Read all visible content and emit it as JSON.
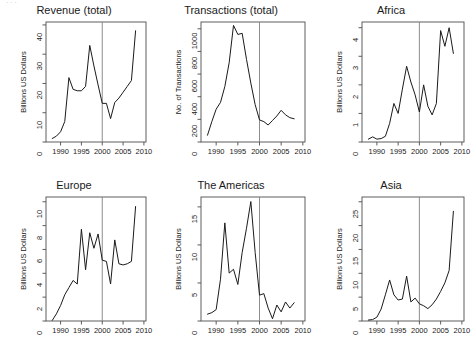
{
  "figure": {
    "background_color": "#ffffff",
    "line_color": "#1a1a1a",
    "axis_color": "#4d4d4d",
    "marker_line_color": "#808080",
    "top_crop_artifact": "·   ·        ·",
    "x_axis_ticks": [
      1990,
      1995,
      2000,
      2005,
      2010
    ],
    "x_axis_range": [
      1986.5,
      2010.5
    ],
    "vertical_marker_year": 2000
  },
  "panels": [
    {
      "id": "revenue-total",
      "title": "Revenue (total)",
      "ylabel": "Billions US Dollars"
    },
    {
      "id": "transactions-total",
      "title": "Transactions (total)",
      "ylabel": "No. of Transactions"
    },
    {
      "id": "africa",
      "title": "Africa",
      "ylabel": "Billions US Dollars"
    },
    {
      "id": "europe",
      "title": "Europe",
      "ylabel": "Billions US Dollars"
    },
    {
      "id": "the-americas",
      "title": "The Americas",
      "ylabel": "Billions US Dollars"
    },
    {
      "id": "asia",
      "title": "Asia",
      "ylabel": "Billions US Dollars"
    }
  ],
  "chart_data": [
    {
      "type": "line",
      "title": "Revenue (total)",
      "xlabel": "",
      "ylabel": "Billions US Dollars",
      "xlim": [
        1986.5,
        2010.5
      ],
      "ylim": [
        0,
        41
      ],
      "xticks": [
        1990,
        1995,
        2000,
        2005,
        2010
      ],
      "yticks": [
        0,
        10,
        20,
        30,
        40
      ],
      "grid": false,
      "legend": "none",
      "annotations": [
        {
          "type": "vline",
          "x": 2000
        }
      ],
      "x": [
        1988,
        1989,
        1990,
        1991,
        1992,
        1993,
        1994,
        1995,
        1996,
        1997,
        1998,
        1999,
        2000,
        2001,
        2002,
        2003,
        2004,
        2005,
        2006,
        2007,
        2008
      ],
      "values": [
        1.2,
        2.0,
        3.5,
        7.0,
        22.0,
        18.0,
        17.5,
        17.5,
        19.0,
        33.0,
        26.0,
        19.5,
        13.2,
        13.2,
        8.0,
        13.5,
        15.0,
        17.0,
        19.0,
        21.0,
        38.0
      ]
    },
    {
      "type": "line",
      "title": "Transactions (total)",
      "xlabel": "",
      "ylabel": "No. of Transactions",
      "xlim": [
        1986.5,
        2010.5
      ],
      "ylim": [
        0,
        1060
      ],
      "xticks": [
        1990,
        1995,
        2000,
        2005,
        2010
      ],
      "yticks": [
        0,
        200,
        400,
        600,
        800,
        1000
      ],
      "grid": false,
      "legend": "none",
      "annotations": [
        {
          "type": "vline",
          "x": 2000
        }
      ],
      "x": [
        1988,
        1989,
        1990,
        1991,
        1992,
        1993,
        1994,
        1995,
        1996,
        1997,
        1998,
        1999,
        2000,
        2001,
        2002,
        2003,
        2004,
        2005,
        2006,
        2007,
        2008
      ],
      "values": [
        60,
        180,
        290,
        350,
        490,
        700,
        1030,
        950,
        960,
        730,
        520,
        330,
        195,
        180,
        150,
        190,
        230,
        280,
        240,
        215,
        205
      ]
    },
    {
      "type": "line",
      "title": "Africa",
      "xlabel": "",
      "ylabel": "Billions US Dollars",
      "xlim": [
        1986.5,
        2010.5
      ],
      "ylim": [
        0,
        4.2
      ],
      "xticks": [
        1990,
        1995,
        2000,
        2005,
        2010
      ],
      "yticks": [
        0,
        1,
        2,
        3,
        4
      ],
      "grid": false,
      "legend": "none",
      "annotations": [
        {
          "type": "vline",
          "x": 2000
        }
      ],
      "x": [
        1988,
        1989,
        1990,
        1991,
        1992,
        1993,
        1994,
        1995,
        1996,
        1997,
        1998,
        1999,
        2000,
        2001,
        2002,
        2003,
        2004,
        2005,
        2006,
        2007,
        2008
      ],
      "values": [
        0.1,
        0.18,
        0.1,
        0.12,
        0.2,
        0.65,
        1.35,
        1.0,
        1.85,
        2.65,
        2.1,
        1.65,
        1.05,
        2.0,
        1.25,
        0.95,
        1.35,
        3.9,
        3.35,
        4.0,
        3.1
      ]
    },
    {
      "type": "line",
      "title": "Europe",
      "xlabel": "",
      "ylabel": "Billions US Dollars",
      "xlim": [
        1986.5,
        2010.5
      ],
      "ylim": [
        0,
        10.4
      ],
      "xticks": [
        1990,
        1995,
        2000,
        2005,
        2010
      ],
      "yticks": [
        0,
        2,
        4,
        6,
        8,
        10
      ],
      "grid": false,
      "legend": "none",
      "annotations": [
        {
          "type": "vline",
          "x": 2000
        }
      ],
      "x": [
        1988,
        1989,
        1990,
        1991,
        1992,
        1993,
        1994,
        1995,
        1996,
        1997,
        1998,
        1999,
        2000,
        2001,
        2002,
        2003,
        2004,
        2005,
        2006,
        2007,
        2008
      ],
      "values": [
        0.05,
        0.6,
        1.3,
        2.2,
        2.8,
        3.4,
        3.1,
        7.7,
        4.3,
        7.4,
        6.1,
        7.3,
        5.1,
        5.0,
        3.1,
        6.8,
        4.8,
        4.7,
        4.8,
        5.0,
        9.6
      ]
    },
    {
      "type": "line",
      "title": "The Americas",
      "xlabel": "",
      "ylabel": "Billions US Dollars",
      "xlim": [
        1986.5,
        2010.5
      ],
      "ylim": [
        0,
        16.3
      ],
      "xticks": [
        1990,
        1995,
        2000,
        2005,
        2010
      ],
      "yticks": [
        0,
        5,
        10,
        15
      ],
      "grid": false,
      "legend": "none",
      "annotations": [
        {
          "type": "vline",
          "x": 2000
        }
      ],
      "x": [
        1988,
        1989,
        1990,
        1991,
        1992,
        1993,
        1994,
        1995,
        1996,
        1997,
        1998,
        1999,
        2000,
        2001,
        2002,
        2003,
        2004,
        2005,
        2006,
        2007,
        2008
      ],
      "values": [
        0.9,
        1.1,
        1.5,
        5.5,
        12.9,
        6.3,
        6.8,
        4.8,
        9.0,
        12.2,
        15.7,
        9.0,
        3.4,
        3.6,
        1.7,
        0.3,
        2.1,
        1.2,
        2.5,
        1.7,
        2.4
      ]
    },
    {
      "type": "line",
      "title": "Asia",
      "xlabel": "",
      "ylabel": "Billions US Dollars",
      "xlim": [
        1986.5,
        2010.5
      ],
      "ylim": [
        0,
        26
      ],
      "xticks": [
        1990,
        1995,
        2000,
        2005,
        2010
      ],
      "yticks": [
        0,
        5,
        10,
        15,
        20,
        25
      ],
      "grid": false,
      "legend": "none",
      "annotations": [
        {
          "type": "vline",
          "x": 2000
        }
      ],
      "x": [
        1988,
        1989,
        1990,
        1991,
        1992,
        1993,
        1994,
        1995,
        1996,
        1997,
        1998,
        1999,
        2000,
        2001,
        2002,
        2003,
        2004,
        2005,
        2006,
        2007,
        2008
      ],
      "values": [
        0.2,
        0.3,
        0.8,
        2.5,
        5.5,
        8.6,
        5.5,
        4.4,
        4.6,
        9.4,
        4.0,
        4.8,
        3.6,
        3.2,
        2.6,
        3.4,
        4.6,
        6.2,
        8.0,
        10.6,
        23.0
      ]
    }
  ]
}
